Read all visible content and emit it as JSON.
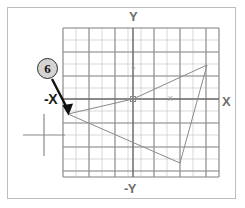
{
  "figure": {
    "kind": "cad-drawing-screenshot",
    "background_color": "#ffffff",
    "frame_border_color": "#bdbdbd"
  },
  "callout": {
    "number": "6",
    "fill_color": "#d6d4d2",
    "border_color": "#2b2b2b",
    "arrow_color": "#111111"
  },
  "axes": {
    "y_label": "Y",
    "negative_y_label": "-Y",
    "x_label": "X",
    "negative_x_label": "-X",
    "label_color": "#6e6e6e",
    "axis_line_color": "#6b6b6b"
  },
  "ucs_icon": {
    "y_label": "Y",
    "x_label": "X",
    "color": "#9a9a9a"
  },
  "grid": {
    "minor_color": "#c9c9c9",
    "major_color": "#8f8f8f",
    "columns": 12,
    "rows": 12,
    "major_every": 4,
    "left": 63,
    "top": 28,
    "cell": 13
  },
  "geometry": {
    "line_color": "#8a8a8a",
    "description": "polygon traced from origin to upper-right apex, down to lower-right vertex, left to the picked point at the crosshair, and back up to origin",
    "points": [
      {
        "name": "origin",
        "x": 133,
        "y": 99
      },
      {
        "name": "apex-upper-right",
        "x": 207,
        "y": 65
      },
      {
        "name": "vertex-lower-right",
        "x": 180,
        "y": 163
      },
      {
        "name": "picked-point",
        "x": 68,
        "y": 114
      }
    ]
  },
  "crosshair_cursor": {
    "x": 44,
    "y": 135,
    "color": "#8a8a8a",
    "arm_length": 21
  }
}
